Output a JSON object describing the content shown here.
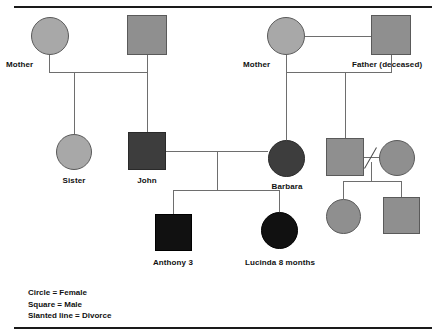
{
  "diagram": {
    "people": [
      {
        "id": "p1",
        "label": "Mother",
        "shape": "circle",
        "fill": "light",
        "sex": "female",
        "generation": 1,
        "family": "left"
      },
      {
        "id": "p2",
        "label": "",
        "shape": "square",
        "fill": "mid",
        "sex": "male",
        "generation": 1,
        "family": "left"
      },
      {
        "id": "p3",
        "label": "Mother",
        "shape": "circle",
        "fill": "light",
        "sex": "female",
        "generation": 1,
        "family": "right"
      },
      {
        "id": "p4",
        "label": "Father (deceased)",
        "shape": "square",
        "fill": "mid",
        "sex": "male",
        "generation": 1,
        "family": "right"
      },
      {
        "id": "p5",
        "label": "Sister",
        "shape": "circle",
        "fill": "light",
        "sex": "female",
        "generation": 2,
        "family": "left"
      },
      {
        "id": "p6",
        "label": "John",
        "shape": "square",
        "fill": "dark",
        "sex": "male",
        "generation": 2,
        "family": "left"
      },
      {
        "id": "p7",
        "label": "Barbara",
        "shape": "circle",
        "fill": "dark",
        "sex": "female",
        "generation": 2,
        "family": "right"
      },
      {
        "id": "p8",
        "label": "",
        "shape": "square",
        "fill": "mid",
        "sex": "male",
        "generation": 2,
        "family": "right"
      },
      {
        "id": "p9",
        "label": "",
        "shape": "circle",
        "fill": "mid",
        "sex": "female",
        "generation": 2,
        "family": "right"
      },
      {
        "id": "p10",
        "label": "Anthony 3",
        "shape": "square",
        "fill": "black",
        "sex": "male",
        "generation": 3,
        "family": "center"
      },
      {
        "id": "p11",
        "label": "Lucinda 8 months",
        "shape": "circle",
        "fill": "black",
        "sex": "female",
        "generation": 3,
        "family": "center"
      },
      {
        "id": "p12",
        "label": "",
        "shape": "circle",
        "fill": "mid",
        "sex": "female",
        "generation": 3,
        "family": "right"
      },
      {
        "id": "p13",
        "label": "",
        "shape": "square",
        "fill": "mid",
        "sex": "male",
        "generation": 3,
        "family": "right"
      }
    ],
    "unions": [
      {
        "partners": [
          "p1",
          "p2"
        ],
        "children": [
          "p5",
          "p6"
        ],
        "divorced": false
      },
      {
        "partners": [
          "p3",
          "p4"
        ],
        "children": [
          "p7",
          "p8"
        ],
        "divorced": false
      },
      {
        "partners": [
          "p6",
          "p7"
        ],
        "children": [
          "p10",
          "p11"
        ],
        "divorced": false
      },
      {
        "partners": [
          "p8",
          "p9"
        ],
        "children": [
          "p12",
          "p13"
        ],
        "divorced": true
      }
    ],
    "labels": {
      "mother_left": "Mother",
      "mother_right": "Mother",
      "father_right": "Father (deceased)",
      "sister": "Sister",
      "john": "John",
      "barbara": "Barbara",
      "anthony": "Anthony 3",
      "lucinda": "Lucinda 8 months"
    }
  },
  "legend": {
    "lines": [
      "Circle = Female",
      "Square = Male",
      "Slanted line = Divorce"
    ]
  },
  "colors": {
    "fill_light": "#a8a8a8",
    "fill_mid": "#8f8f8f",
    "fill_dark": "#3d3d3d",
    "fill_black": "#111111",
    "line": "#6e6e6e",
    "rule": "#1a1a1a",
    "text": "#111111"
  }
}
